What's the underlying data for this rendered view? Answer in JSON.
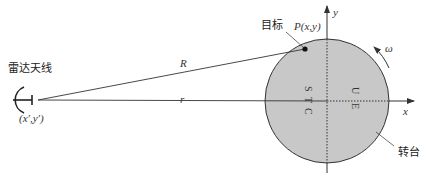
{
  "diagram": {
    "labels": {
      "antenna": "雷达天线",
      "antenna_coords": "(x′,y′)",
      "target": "目标",
      "point": "P(x,y)",
      "R": "R",
      "r": "r",
      "omega": "ω",
      "turntable": "转台",
      "x_axis": "x",
      "y_axis": "y",
      "stc": [
        "S",
        "T",
        "C"
      ],
      "ue": [
        "U",
        "E"
      ]
    },
    "colors": {
      "disc_fill": "#c8c8c8",
      "stroke": "#333333"
    }
  }
}
